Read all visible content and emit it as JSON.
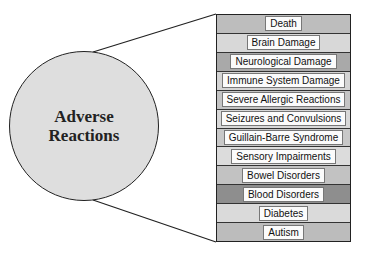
{
  "diagram": {
    "center": {
      "label": "Adverse\nReactions",
      "fill": "#dedede"
    },
    "items": [
      {
        "label": "Death",
        "fill": "#bdbdbd"
      },
      {
        "label": "Brain Damage",
        "fill": "#d8d8d8"
      },
      {
        "label": "Neurological Damage",
        "fill": "#a9a9a9"
      },
      {
        "label": "Immune System Damage",
        "fill": "#d4d4d4"
      },
      {
        "label": "Severe Allergic Reactions",
        "fill": "#c4c4c4"
      },
      {
        "label": "Seizures and Convulsions",
        "fill": "#d8d8d8"
      },
      {
        "label": "Guillain-Barre Syndrome",
        "fill": "#c8c8c8"
      },
      {
        "label": "Sensory Impairments",
        "fill": "#dcdcdc"
      },
      {
        "label": "Bowel Disorders",
        "fill": "#c2c2c2"
      },
      {
        "label": "Blood Disorders",
        "fill": "#8e8e8e"
      },
      {
        "label": "Diabetes",
        "fill": "#dadada"
      },
      {
        "label": "Autism",
        "fill": "#bcbcbc"
      }
    ]
  }
}
